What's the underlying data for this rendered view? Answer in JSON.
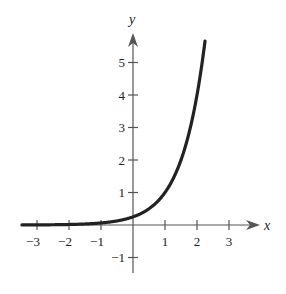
{
  "chart_data": {
    "type": "line",
    "title": "",
    "xlabel": "x",
    "ylabel": "y",
    "xlim": [
      -3.5,
      3.8
    ],
    "ylim": [
      -1.5,
      5.8
    ],
    "xticks": [
      -3,
      -2,
      -1,
      1,
      2,
      3
    ],
    "yticks": [
      -1,
      1,
      2,
      3,
      4,
      5
    ],
    "xtick_labels": [
      "−3",
      "−2",
      "−1",
      "1",
      "2",
      "3"
    ],
    "ytick_labels": [
      "−1",
      "1",
      "2",
      "3",
      "4",
      "5"
    ],
    "grid": false,
    "legend": null,
    "series": [
      {
        "name": "exponential curve",
        "function": "y = 4^(x-1)",
        "x": [
          -3.5,
          -3,
          -2,
          -1,
          0,
          0.5,
          1,
          1.5,
          2,
          2.25
        ],
        "y": [
          0.002,
          0.004,
          0.016,
          0.0625,
          0.25,
          0.5,
          1,
          2,
          4,
          5.66
        ],
        "color": "#222222"
      }
    ]
  },
  "colors": {
    "axis": "#555555",
    "curve": "#222222"
  }
}
